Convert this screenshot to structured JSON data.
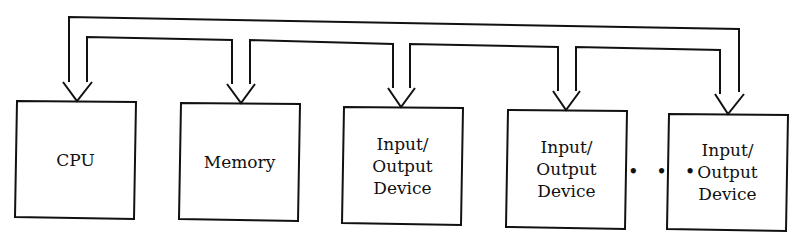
{
  "diagram": {
    "type": "bus-architecture",
    "boxes": [
      {
        "id": "cpu",
        "label": "CPU"
      },
      {
        "id": "memory",
        "label": "Memory"
      },
      {
        "id": "io1",
        "line1": "Input/",
        "line2": "Output",
        "line3": "Device"
      },
      {
        "id": "io2",
        "line1": "Input/",
        "line2": "Output",
        "line3": "Device"
      },
      {
        "id": "io3",
        "line1": "Input/",
        "line2": "Output",
        "line3": "Device"
      }
    ],
    "ellipsis": "• • •",
    "connections": "shared bus with arrows into every component",
    "colors": {
      "stroke": "#111111",
      "background": "#ffffff"
    }
  }
}
